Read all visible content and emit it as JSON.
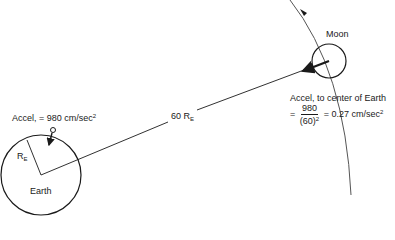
{
  "diagram": {
    "earth": {
      "label": "Earth",
      "radius_label": "R",
      "radius_sub": "E",
      "accel_label": "Accel, = 980 cm/sec",
      "accel_sup": "2"
    },
    "moon": {
      "label": "Moon",
      "accel_label": "Accel, to center of Earth",
      "formula_prefix": "=",
      "numerator": "980",
      "denominator": "(60)",
      "denominator_sup": "2",
      "result": "= 0.27 cm/sec",
      "result_sup": "2"
    },
    "distance": {
      "label": "60 R",
      "sub": "E"
    },
    "colors": {
      "stroke": "#1a1a1a",
      "orbit": "#555555",
      "background": "#ffffff"
    }
  }
}
